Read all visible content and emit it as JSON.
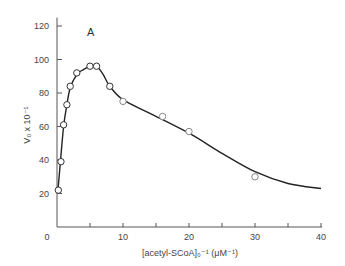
{
  "chart_data": {
    "type": "line",
    "title": "",
    "panel_label": "A",
    "xlabel": "[acetyl-SCoA]₀⁻¹  (μM⁻¹)",
    "ylabel": "V₀ x 10⁻¹",
    "xlim": [
      0,
      40
    ],
    "ylim": [
      0,
      125
    ],
    "x_ticks": [
      0,
      5,
      10,
      15,
      20,
      25,
      30,
      35,
      40
    ],
    "x_tick_labels": [
      "0",
      "10",
      "20",
      "30",
      "40"
    ],
    "y_ticks": [
      20,
      40,
      60,
      80,
      100,
      120
    ],
    "y_tick_labels": [
      "20",
      "40",
      "60",
      "80",
      "100",
      "120"
    ],
    "grid": false,
    "legend": null,
    "series": [
      {
        "name": "measured",
        "style": "open-circle markers",
        "x": [
          0.2,
          0.6,
          1.0,
          1.5,
          2.0,
          3.0,
          5.0,
          6.0,
          8.0,
          10.0,
          16.0,
          20.0,
          30.0
        ],
        "y": [
          22,
          39,
          61,
          73,
          84,
          92,
          96,
          96,
          84,
          75,
          66,
          57,
          30
        ]
      },
      {
        "name": "fitted curve",
        "style": "solid line",
        "x": [
          0.1,
          0.5,
          1.0,
          1.5,
          2.0,
          3.0,
          4.0,
          5.0,
          6.0,
          7.0,
          8.0,
          10.0,
          14.0,
          20.0,
          25.0,
          30.0,
          35.0,
          40.0
        ],
        "y": [
          20,
          38,
          60,
          73,
          83,
          91,
          94,
          96,
          96,
          91,
          84,
          76,
          68,
          56,
          44,
          33,
          26,
          23
        ]
      }
    ]
  }
}
